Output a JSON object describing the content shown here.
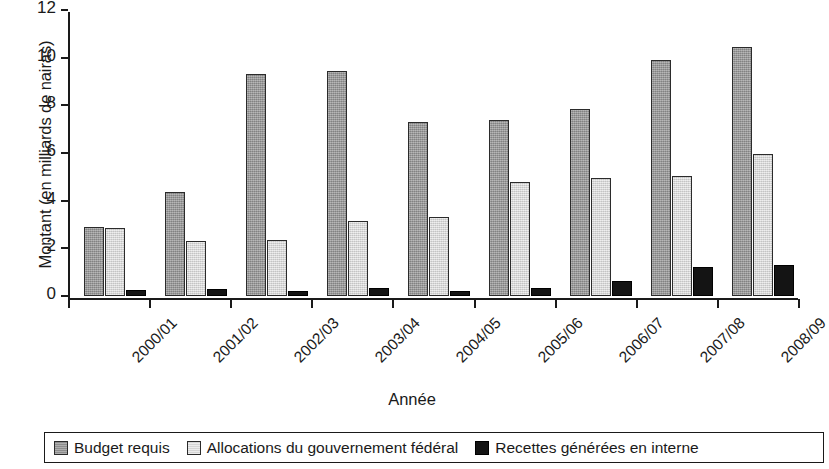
{
  "chart_data": {
    "type": "bar",
    "title": "",
    "subtitle": "",
    "xlabel": "Année",
    "ylabel": "Montant (en milliards de nairas)",
    "categories": [
      "2000/01",
      "2001/02",
      "2002/03",
      "2003/04",
      "2004/05",
      "2005/06",
      "2006/07",
      "2007/08",
      "2008/09"
    ],
    "series": [
      {
        "name": "Budget requis",
        "color": "#9d9d9d",
        "values": [
          2.9,
          4.35,
          9.3,
          9.45,
          7.3,
          7.4,
          7.85,
          9.9,
          10.45
        ]
      },
      {
        "name": "Allocations du gouvernement fédéral",
        "color": "#dedede",
        "values": [
          2.85,
          2.3,
          2.35,
          3.15,
          3.3,
          4.8,
          4.95,
          5.05,
          5.95
        ]
      },
      {
        "name": "Recettes générées en interne",
        "color": "#141414",
        "values": [
          0.25,
          0.3,
          0.2,
          0.35,
          0.2,
          0.35,
          0.65,
          1.2,
          1.3
        ]
      }
    ],
    "ylim": [
      0,
      12
    ],
    "yticks": [
      0,
      2,
      4,
      6,
      8,
      10,
      12
    ],
    "ytick_labels": [
      "0",
      "2",
      "4",
      "6",
      "8",
      "10",
      "12"
    ],
    "grid": false,
    "legend_position": "bottom"
  }
}
